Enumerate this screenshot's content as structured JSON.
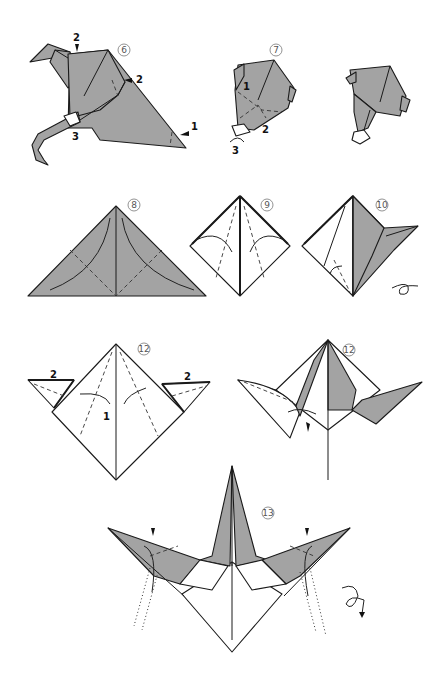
{
  "diagram": {
    "type": "origami folding instructions",
    "colors": {
      "paper_colored": "#a3a3a3",
      "paper_white": "#ffffff",
      "line": "#1a1a1a",
      "background": "#ffffff"
    },
    "steps": [
      {
        "id": "step-6",
        "number": "6",
        "labels": [
          "2",
          "2",
          "1",
          "3"
        ]
      },
      {
        "id": "step-7",
        "number": "7",
        "labels": [
          "1",
          "2",
          "3"
        ]
      },
      {
        "id": "step-7-result",
        "number": "",
        "labels": []
      },
      {
        "id": "step-8",
        "number": "8",
        "labels": []
      },
      {
        "id": "step-9",
        "number": "9",
        "labels": []
      },
      {
        "id": "step-10",
        "number": "10",
        "labels": [],
        "symbol": "turn-over"
      },
      {
        "id": "step-11",
        "number": "11",
        "labels": [
          "2",
          "2",
          "1"
        ]
      },
      {
        "id": "step-12",
        "number": "12",
        "labels": []
      },
      {
        "id": "step-13",
        "number": "13",
        "labels": [],
        "symbol": "turn-over"
      }
    ]
  }
}
